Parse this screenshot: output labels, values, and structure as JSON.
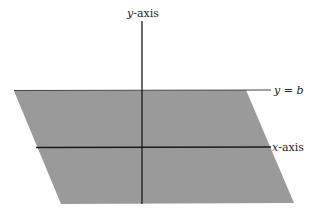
{
  "diagram": {
    "labels": {
      "y_axis": {
        "var": "y",
        "suffix": "-axis"
      },
      "x_axis": {
        "var": "x",
        "suffix": "-axis"
      },
      "line": {
        "var": "y",
        "eq": " = ",
        "val": "b"
      }
    },
    "region": {
      "shape": "parallelogram",
      "fill": "#9a9a9a",
      "top_boundary": "y = b"
    },
    "colors": {
      "axis": "#1a1a1a",
      "boundary_line": "#444444",
      "background": "#ffffff"
    }
  }
}
